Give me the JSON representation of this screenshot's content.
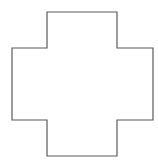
{
  "diagram": {
    "shape": "cross",
    "stroke_color": "#5a5a5a",
    "fill_color": "#ffffff",
    "points": "47,12 117,12 117,48 153,48 153,120 117,120 117,156 47,156 47,120 12,120 12,48 47,48"
  }
}
